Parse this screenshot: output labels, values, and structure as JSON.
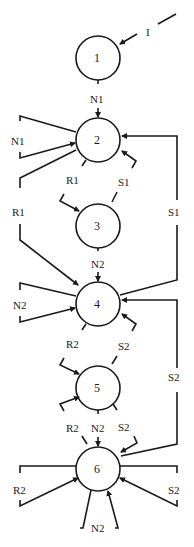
{
  "diagram": {
    "type": "state-transition-diagram",
    "states": [
      {
        "id": "1",
        "label": "1"
      },
      {
        "id": "2",
        "label": "2"
      },
      {
        "id": "3",
        "label": "3"
      },
      {
        "id": "4",
        "label": "4"
      },
      {
        "id": "5",
        "label": "5"
      },
      {
        "id": "6",
        "label": "6"
      }
    ],
    "edge_labels": {
      "initial": "I",
      "s1_to_s2": "N1",
      "s2_self_loop": "N1",
      "s2_to_s3": "R1",
      "s3_to_s2": "S1",
      "s2_to_s4": "R1",
      "s4_to_s2": "S1",
      "s3_to_s4": "N2",
      "s4_self_loop": "N2",
      "s4_to_s5": "R2",
      "s5_to_s4": "S2",
      "s6_to_s4": "S2",
      "s5_to_s6_r": "R2",
      "s5_to_s6_n": "N2",
      "s5_to_s6_s": "S2",
      "s6_self_r": "R2",
      "s6_self_s": "S2",
      "s6_self_n": "N2"
    }
  }
}
